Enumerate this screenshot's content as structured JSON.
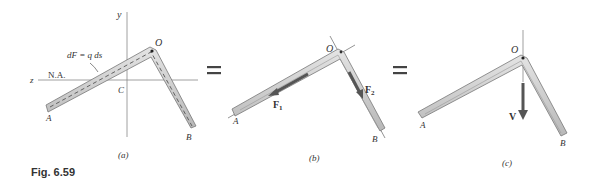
{
  "figure": {
    "caption": "Fig. 6.59",
    "panels": [
      {
        "id": "a",
        "caption": "(a)",
        "labels": {
          "y_axis": "y",
          "z_axis": "z",
          "neutral_axis": "N.A.",
          "force_element": "dF = q ds",
          "centroid": "C",
          "corner": "O",
          "end_a": "A",
          "end_b": "B"
        }
      },
      {
        "id": "b",
        "caption": "(b)",
        "labels": {
          "corner": "O",
          "end_a": "A",
          "end_b": "B",
          "force_1": "F",
          "force_1_sub": "1",
          "force_2": "F",
          "force_2_sub": "2"
        }
      },
      {
        "id": "c",
        "caption": "(c)",
        "labels": {
          "corner": "O",
          "end_a": "A",
          "end_b": "B",
          "shear_force": "V"
        }
      }
    ],
    "equals_signs": [
      "=",
      "="
    ],
    "colors": {
      "member_fill": "#cfcfcf",
      "member_edge": "#7a7a7a",
      "arrow": "#555555",
      "axis": "#888888"
    }
  }
}
